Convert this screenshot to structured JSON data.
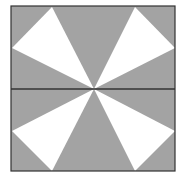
{
  "diagram": {
    "colors": {
      "background": "#ffffff",
      "gray_fill": "#a3a3a3",
      "white_fill": "#ffffff",
      "stroke": "#333333"
    },
    "square": {
      "x": 11,
      "y": 6,
      "width": 164,
      "height": 165
    },
    "center": {
      "x": 94,
      "y": 89
    },
    "white_triangles": [
      {
        "name": "top-left",
        "points": "94,89 52,7 12,48"
      },
      {
        "name": "top-right",
        "points": "94,89 135,7 175,48"
      },
      {
        "name": "bottom-left",
        "points": "94,89 12,131 52,171"
      },
      {
        "name": "bottom-right",
        "points": "94,89 175,131 135,171"
      }
    ]
  }
}
